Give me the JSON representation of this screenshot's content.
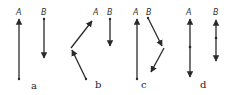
{
  "figure": {
    "point_labels": {
      "A": "A",
      "B": "B"
    },
    "panels": [
      {
        "id": "a",
        "label": "a"
      },
      {
        "id": "b",
        "label": "b"
      },
      {
        "id": "c",
        "label": "c"
      },
      {
        "id": "d",
        "label": "d"
      }
    ],
    "colors": {
      "ink": "#2a2a2a",
      "background": "#ffffff"
    }
  }
}
